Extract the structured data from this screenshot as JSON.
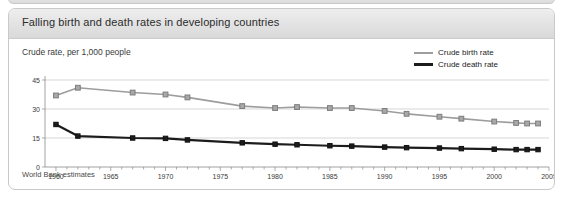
{
  "card": {
    "title": "Falling birth and death rates in developing countries",
    "subtitle": "Crude rate, per 1,000 people",
    "source": "World Bank estimates"
  },
  "legend": {
    "position": "top-right",
    "items": [
      {
        "label": "Crude birth rate",
        "color": "#9d9d9d"
      },
      {
        "label": "Crude death rate",
        "color": "#1c1c1c"
      }
    ]
  },
  "chart_data": {
    "type": "line",
    "title": "Falling birth and death rates in developing countries",
    "subtitle": "Crude rate, per 1,000 people",
    "xlabel": "",
    "ylabel": "Crude rate, per 1,000 people",
    "xlim": [
      1959,
      2005
    ],
    "ylim": [
      0,
      45
    ],
    "yticks": [
      0,
      15,
      30,
      45
    ],
    "xticks": [
      1960,
      1965,
      1970,
      1975,
      1980,
      1985,
      1990,
      1995,
      2000,
      2005
    ],
    "grid": "horizontal",
    "minor_xticks": "every year",
    "markers": "square",
    "source": "World Bank estimates",
    "series": [
      {
        "name": "Crude birth rate",
        "color": "#9d9d9d",
        "marker_fill": "#a8a8a8",
        "points": [
          {
            "x": 1960,
            "y": 37
          },
          {
            "x": 1962,
            "y": 41
          },
          {
            "x": 1967,
            "y": 38.5
          },
          {
            "x": 1970,
            "y": 37.5
          },
          {
            "x": 1972,
            "y": 36
          },
          {
            "x": 1977,
            "y": 31.5
          },
          {
            "x": 1980,
            "y": 30.5
          },
          {
            "x": 1982,
            "y": 31
          },
          {
            "x": 1985,
            "y": 30.5
          },
          {
            "x": 1987,
            "y": 30.5
          },
          {
            "x": 1990,
            "y": 29
          },
          {
            "x": 1992,
            "y": 27.5
          },
          {
            "x": 1995,
            "y": 26
          },
          {
            "x": 1997,
            "y": 25
          },
          {
            "x": 2000,
            "y": 23.5
          },
          {
            "x": 2002,
            "y": 22.8
          },
          {
            "x": 2003,
            "y": 22.5
          },
          {
            "x": 2004,
            "y": 22.5
          }
        ]
      },
      {
        "name": "Crude death rate",
        "color": "#1c1c1c",
        "marker_fill": "#1c1c1c",
        "points": [
          {
            "x": 1960,
            "y": 22
          },
          {
            "x": 1962,
            "y": 16
          },
          {
            "x": 1967,
            "y": 15
          },
          {
            "x": 1970,
            "y": 14.8
          },
          {
            "x": 1972,
            "y": 14
          },
          {
            "x": 1977,
            "y": 12.5
          },
          {
            "x": 1980,
            "y": 11.8
          },
          {
            "x": 1982,
            "y": 11.5
          },
          {
            "x": 1985,
            "y": 11
          },
          {
            "x": 1987,
            "y": 10.8
          },
          {
            "x": 1990,
            "y": 10.3
          },
          {
            "x": 1992,
            "y": 10
          },
          {
            "x": 1995,
            "y": 9.8
          },
          {
            "x": 1997,
            "y": 9.5
          },
          {
            "x": 2000,
            "y": 9.2
          },
          {
            "x": 2002,
            "y": 9
          },
          {
            "x": 2003,
            "y": 9
          },
          {
            "x": 2004,
            "y": 9
          }
        ]
      }
    ]
  }
}
